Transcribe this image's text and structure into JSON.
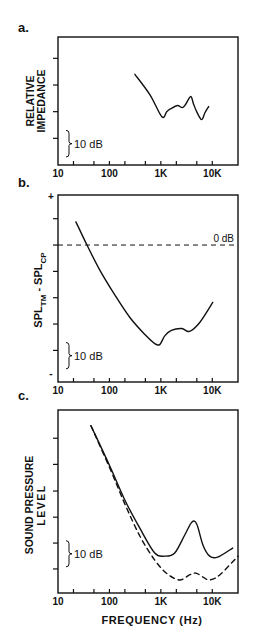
{
  "chart_data": [
    {
      "type": "line",
      "panel_label": "a.",
      "title": "",
      "xlabel": "",
      "ylabel": "RELATIVE IMPEDANCE",
      "x_scale": "log",
      "xlim": [
        10,
        31623
      ],
      "ylim": [
        0,
        48
      ],
      "x_ticks": [
        20,
        50,
        100,
        200,
        500,
        1000,
        2000,
        5000,
        10000
      ],
      "x_tick_labels": [
        {
          "value": 10,
          "text": "10"
        },
        {
          "value": 100,
          "text": "100"
        },
        {
          "value": 1000,
          "text": "1K"
        },
        {
          "value": 10000,
          "text": "10K"
        }
      ],
      "y_ticks": [
        10,
        20,
        30,
        40
      ],
      "scale_bar": {
        "text": "10 dB",
        "from": 3,
        "to": 13
      },
      "grid": false,
      "series": [
        {
          "name": "impedance",
          "style": "solid",
          "x": [
            313,
            611,
            1047,
            1300,
            1560,
            2100,
            2600,
            3000,
            3800,
            4300,
            4970,
            6200,
            7200,
            8500
          ],
          "y": [
            34,
            26.4,
            18.1,
            20,
            21.1,
            22.3,
            21.5,
            22.6,
            25.7,
            23,
            20,
            17,
            19.6,
            21.9
          ]
        }
      ]
    },
    {
      "type": "line",
      "panel_label": "b.",
      "title": "",
      "xlabel": "",
      "ylabel": "SPL_TM - SPL_CP",
      "ylabel_parts": {
        "a": "SPL",
        "a_sub": "TM",
        "sep": " - ",
        "b": "SPL",
        "b_sub": "CP"
      },
      "x_scale": "log",
      "xlim": [
        10,
        31623
      ],
      "ylim": [
        -52,
        19
      ],
      "x_ticks": [
        20,
        50,
        100,
        200,
        500,
        1000,
        2000,
        5000,
        10000
      ],
      "x_tick_labels": [
        {
          "value": 10,
          "text": "10"
        },
        {
          "value": 100,
          "text": "100"
        },
        {
          "value": 1000,
          "text": "1K"
        },
        {
          "value": 10000,
          "text": "10K"
        }
      ],
      "y_ticks": [
        10,
        0,
        -10,
        -20,
        -30,
        -40
      ],
      "y_end_labels": {
        "top": "+",
        "bottom": "-"
      },
      "reference_line": {
        "y": 0,
        "style": "dashed",
        "label": "0 dB"
      },
      "scale_bar": {
        "text": "10 dB",
        "from": -47,
        "to": -37
      },
      "grid": false,
      "series": [
        {
          "name": "difference",
          "style": "solid",
          "x": [
            22.3,
            36.6,
            65,
            128,
            250,
            490,
            760,
            950,
            1200,
            1600,
            2550,
            3600,
            5700,
            10200
          ],
          "y": [
            8.8,
            0,
            -9.5,
            -19,
            -27.5,
            -34,
            -37.4,
            -37.8,
            -34.4,
            -32.4,
            -31.7,
            -32.8,
            -29.4,
            -21.8
          ]
        }
      ]
    },
    {
      "type": "line",
      "panel_label": "c.",
      "title": "",
      "xlabel": "FREQUENCY (Hz)",
      "ylabel": "SOUND PRESSURE LEVEL",
      "ylabel_lines": [
        "SOUND PRESSURE",
        "LEVEL"
      ],
      "x_scale": "log",
      "xlim": [
        10,
        31623
      ],
      "ylim": [
        0,
        70
      ],
      "x_ticks": [
        20,
        50,
        100,
        200,
        500,
        1000,
        2000,
        5000,
        10000
      ],
      "x_tick_labels": [
        {
          "value": 10,
          "text": "10"
        },
        {
          "value": 100,
          "text": "100"
        },
        {
          "value": 1000,
          "text": "1K"
        },
        {
          "value": 10000,
          "text": "10K"
        }
      ],
      "y_ticks": [
        9.2,
        19.1,
        29,
        39,
        49.2,
        59.2
      ],
      "scale_bar": {
        "text": "10 dB",
        "from": 10,
        "to": 20
      },
      "grid": false,
      "series": [
        {
          "name": "solid",
          "style": "solid",
          "x": [
            43.7,
            102,
            200,
            390,
            760,
            1200,
            1860,
            2900,
            4000,
            5000,
            6600,
            8900,
            12700,
            24900
          ],
          "y": [
            64,
            48.5,
            35.5,
            24.8,
            15.3,
            14.1,
            15.3,
            22.1,
            27.1,
            26.3,
            18.3,
            14.1,
            13.7,
            17.2
          ]
        },
        {
          "name": "dashed",
          "style": "dashed",
          "x": [
            43.7,
            102,
            200,
            390,
            760,
            1340,
            2330,
            3600,
            4800,
            6600,
            8900,
            13900,
            31600
          ],
          "y": [
            64,
            47.7,
            34,
            21.8,
            12.6,
            7.3,
            5,
            6.9,
            7.6,
            6.1,
            5,
            6.9,
            14.1
          ]
        }
      ]
    }
  ]
}
